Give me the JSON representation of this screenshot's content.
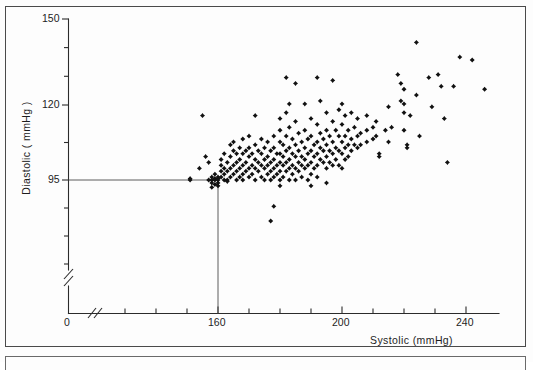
{
  "figure": {
    "background": "#fdfdfd",
    "frame_color": "#4a4a4a",
    "marker_color": "#111111"
  },
  "axes": {
    "y_label": "Diastolic ( mmHg )",
    "x_label": "Systolic (mmHg)",
    "origin_label": "0",
    "y_ticks_major": [
      "150",
      "120",
      "95"
    ],
    "x_ticks_major": [
      "160",
      "200",
      "240"
    ],
    "y_axis_break": true,
    "x_axis_break": true,
    "reference_lines": {
      "y": 95,
      "x": 160
    }
  },
  "chart_data": {
    "type": "scatter",
    "title": "",
    "xlabel": "Systolic (mmHg)",
    "ylabel": "Diastolic ( mmHg )",
    "xlim": [
      145,
      250
    ],
    "ylim": [
      80,
      150
    ],
    "grid": false,
    "legend": null,
    "reference_line_x": 160,
    "reference_line_y": 95,
    "marker": "diamond",
    "n_points": 236,
    "points": [
      [
        151,
        95
      ],
      [
        151,
        95.5
      ],
      [
        154,
        99
      ],
      [
        155,
        117
      ],
      [
        156,
        103
      ],
      [
        157,
        101
      ],
      [
        157,
        95
      ],
      [
        158,
        96
      ],
      [
        158,
        95
      ],
      [
        158,
        94
      ],
      [
        158,
        92.5
      ],
      [
        159,
        95
      ],
      [
        159,
        95.5
      ],
      [
        159,
        97
      ],
      [
        159,
        93.5
      ],
      [
        160,
        95
      ],
      [
        160,
        95.5
      ],
      [
        160,
        96
      ],
      [
        160,
        94
      ],
      [
        160,
        93
      ],
      [
        161,
        98
      ],
      [
        161,
        100
      ],
      [
        161,
        102
      ],
      [
        161,
        96
      ],
      [
        162,
        104
      ],
      [
        162,
        99
      ],
      [
        162,
        97
      ],
      [
        162,
        95
      ],
      [
        163,
        101
      ],
      [
        163,
        98
      ],
      [
        163,
        95
      ],
      [
        163,
        94.5
      ],
      [
        164,
        107
      ],
      [
        164,
        103
      ],
      [
        164,
        99
      ],
      [
        164,
        96
      ],
      [
        165,
        108
      ],
      [
        165,
        105
      ],
      [
        165,
        100
      ],
      [
        165,
        97
      ],
      [
        166,
        104
      ],
      [
        166,
        101
      ],
      [
        166,
        98
      ],
      [
        166,
        95
      ],
      [
        167,
        106
      ],
      [
        167,
        102
      ],
      [
        167,
        99
      ],
      [
        167,
        96
      ],
      [
        168,
        109
      ],
      [
        168,
        104
      ],
      [
        168,
        100
      ],
      [
        168,
        97
      ],
      [
        168,
        95
      ],
      [
        169,
        105
      ],
      [
        169,
        101
      ],
      [
        169,
        98
      ],
      [
        170,
        110
      ],
      [
        170,
        106
      ],
      [
        170,
        103
      ],
      [
        170,
        99
      ],
      [
        170,
        96
      ],
      [
        171,
        104
      ],
      [
        171,
        100
      ],
      [
        171,
        97
      ],
      [
        172,
        117
      ],
      [
        172,
        107
      ],
      [
        172,
        102
      ],
      [
        172,
        99
      ],
      [
        172,
        95
      ],
      [
        173,
        105
      ],
      [
        173,
        101
      ],
      [
        173,
        98
      ],
      [
        174,
        109
      ],
      [
        174,
        104
      ],
      [
        174,
        100
      ],
      [
        174,
        96
      ],
      [
        175,
        106
      ],
      [
        175,
        102
      ],
      [
        175,
        99
      ],
      [
        175,
        95
      ],
      [
        176,
        108
      ],
      [
        176,
        103
      ],
      [
        176,
        100
      ],
      [
        176,
        97
      ],
      [
        177,
        105
      ],
      [
        177,
        101
      ],
      [
        177,
        98
      ],
      [
        177,
        95
      ],
      [
        178,
        110
      ],
      [
        178,
        106
      ],
      [
        178,
        102
      ],
      [
        178,
        99
      ],
      [
        178,
        96
      ],
      [
        179,
        104
      ],
      [
        179,
        100
      ],
      [
        179,
        97
      ],
      [
        180,
        116
      ],
      [
        180,
        112
      ],
      [
        180,
        108
      ],
      [
        180,
        104
      ],
      [
        180,
        101
      ],
      [
        180,
        98
      ],
      [
        180,
        95
      ],
      [
        180,
        93
      ],
      [
        181,
        107
      ],
      [
        181,
        103
      ],
      [
        181,
        100
      ],
      [
        181,
        96
      ],
      [
        182,
        130
      ],
      [
        182,
        118
      ],
      [
        182,
        110
      ],
      [
        182,
        105
      ],
      [
        182,
        101
      ],
      [
        182,
        98
      ],
      [
        183,
        121
      ],
      [
        183,
        113
      ],
      [
        183,
        106
      ],
      [
        183,
        102
      ],
      [
        183,
        99
      ],
      [
        183,
        95
      ],
      [
        184,
        109
      ],
      [
        184,
        104
      ],
      [
        184,
        100
      ],
      [
        184,
        97
      ],
      [
        185,
        128
      ],
      [
        185,
        115
      ],
      [
        185,
        107
      ],
      [
        185,
        103
      ],
      [
        185,
        99
      ],
      [
        185,
        95
      ],
      [
        186,
        111
      ],
      [
        186,
        105
      ],
      [
        186,
        101
      ],
      [
        186,
        98
      ],
      [
        187,
        108
      ],
      [
        187,
        103
      ],
      [
        187,
        100
      ],
      [
        187,
        96
      ],
      [
        188,
        121
      ],
      [
        188,
        112
      ],
      [
        188,
        106
      ],
      [
        188,
        102
      ],
      [
        188,
        99
      ],
      [
        189,
        109
      ],
      [
        189,
        104
      ],
      [
        189,
        100
      ],
      [
        189,
        95
      ],
      [
        190,
        116
      ],
      [
        190,
        110
      ],
      [
        190,
        105
      ],
      [
        190,
        101
      ],
      [
        190,
        97
      ],
      [
        190,
        93
      ],
      [
        191,
        107
      ],
      [
        191,
        103
      ],
      [
        191,
        99
      ],
      [
        192,
        130
      ],
      [
        192,
        114
      ],
      [
        192,
        108
      ],
      [
        192,
        104
      ],
      [
        192,
        100
      ],
      [
        192,
        96
      ],
      [
        193,
        122
      ],
      [
        193,
        111
      ],
      [
        193,
        106
      ],
      [
        193,
        102
      ],
      [
        194,
        109
      ],
      [
        194,
        105
      ],
      [
        194,
        101
      ],
      [
        195,
        118
      ],
      [
        195,
        112
      ],
      [
        195,
        107
      ],
      [
        195,
        103
      ],
      [
        195,
        99
      ],
      [
        195,
        94
      ],
      [
        196,
        110
      ],
      [
        196,
        105
      ],
      [
        196,
        101
      ],
      [
        197,
        129
      ],
      [
        197,
        115
      ],
      [
        197,
        108
      ],
      [
        197,
        104
      ],
      [
        197,
        100
      ],
      [
        198,
        112
      ],
      [
        198,
        106
      ],
      [
        198,
        102
      ],
      [
        199,
        119
      ],
      [
        199,
        110
      ],
      [
        199,
        105
      ],
      [
        199,
        100
      ],
      [
        200,
        121
      ],
      [
        200,
        114
      ],
      [
        200,
        108
      ],
      [
        200,
        104
      ],
      [
        200,
        99
      ],
      [
        201,
        117
      ],
      [
        201,
        110
      ],
      [
        201,
        106
      ],
      [
        201,
        102
      ],
      [
        202,
        112
      ],
      [
        202,
        107
      ],
      [
        202,
        103
      ],
      [
        203,
        118
      ],
      [
        203,
        109
      ],
      [
        203,
        105
      ],
      [
        204,
        113
      ],
      [
        204,
        107
      ],
      [
        205,
        116
      ],
      [
        205,
        110
      ],
      [
        205,
        106
      ],
      [
        206,
        111
      ],
      [
        206,
        107
      ],
      [
        208,
        117
      ],
      [
        208,
        112
      ],
      [
        208,
        108
      ],
      [
        210,
        113
      ],
      [
        210,
        109
      ],
      [
        211,
        115
      ],
      [
        211,
        110
      ],
      [
        212,
        104
      ],
      [
        212,
        103
      ],
      [
        214,
        112
      ],
      [
        215,
        120
      ],
      [
        215,
        108
      ],
      [
        216,
        113
      ],
      [
        218,
        131
      ],
      [
        219,
        128
      ],
      [
        219,
        122
      ],
      [
        220,
        126
      ],
      [
        220,
        121
      ],
      [
        220,
        118
      ],
      [
        220,
        112
      ],
      [
        221,
        107
      ],
      [
        221,
        106
      ],
      [
        222,
        117
      ],
      [
        224,
        142
      ],
      [
        224,
        124
      ],
      [
        225,
        110
      ],
      [
        228,
        130
      ],
      [
        229,
        120
      ],
      [
        231,
        131
      ],
      [
        232,
        127
      ],
      [
        233,
        116
      ],
      [
        234,
        101
      ],
      [
        236,
        127
      ],
      [
        238,
        137
      ],
      [
        242,
        136
      ],
      [
        246,
        126
      ],
      [
        178,
        86
      ],
      [
        177,
        81
      ]
    ]
  }
}
